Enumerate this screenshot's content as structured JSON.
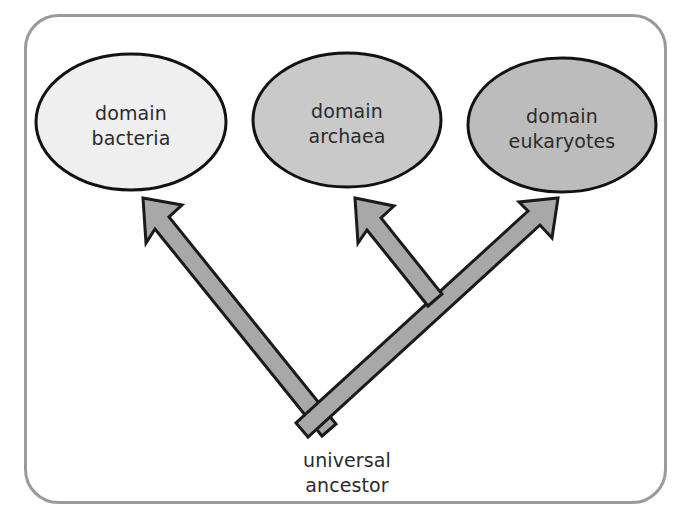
{
  "figure": {
    "frame": {
      "name": "rounded-frame",
      "stroke_color": "#9a9a9a",
      "fill_color": "#ffffff",
      "x": 24,
      "y": 14,
      "width": 643,
      "height": 490,
      "radius": 34,
      "stroke_width": 3
    },
    "background_color": "#ffffff",
    "text_color": "#2b2b2b",
    "arrow_fill_color": "#a8a8a8",
    "arrow_stroke_color": "#1a1a1a"
  },
  "nodes": [
    {
      "id": "bacteria",
      "name": "domain-bacteria-ellipse",
      "label_line1": "domain",
      "label_line2": "bacteria",
      "cx": 131,
      "cy": 122,
      "rx": 95,
      "ry": 68,
      "fill_color": "#efefef",
      "stroke_color": "#121212",
      "stroke_width": 3
    },
    {
      "id": "archaea",
      "name": "domain-archaea-ellipse",
      "label_line1": "domain",
      "label_line2": "archaea",
      "cx": 347,
      "cy": 120,
      "rx": 94,
      "ry": 67,
      "fill_color": "#c9c9c9",
      "stroke_color": "#121212",
      "stroke_width": 3
    },
    {
      "id": "eukaryotes",
      "name": "domain-eukaryotes-ellipse",
      "label_line1": "domain",
      "label_line2": "eukaryotes",
      "cx": 562,
      "cy": 125,
      "rx": 94,
      "ry": 67,
      "fill_color": "#bcbcbc",
      "stroke_color": "#121212",
      "stroke_width": 3
    }
  ],
  "root": {
    "id": "universal-ancestor",
    "name": "universal-ancestor-label",
    "label_line1": "universal",
    "label_line2": "ancestor",
    "x": 347,
    "line1_y": 461,
    "line2_y": 486,
    "junction_x": 322,
    "junction_y": 432
  },
  "arrows": [
    {
      "id": "arrow-to-bacteria",
      "name": "arrow-to-bacteria",
      "from": "universal ancestor",
      "to": "domain bacteria",
      "tip_x": 143,
      "tip_y": 198
    },
    {
      "id": "arrow-to-archaea",
      "name": "arrow-to-archaea",
      "from": "universal ancestor",
      "to": "domain archaea",
      "tip_x": 355,
      "tip_y": 198
    },
    {
      "id": "arrow-to-eukaryotes",
      "name": "arrow-to-eukaryotes",
      "from": "universal ancestor",
      "to": "domain eukaryotes",
      "tip_x": 558,
      "tip_y": 198
    }
  ]
}
